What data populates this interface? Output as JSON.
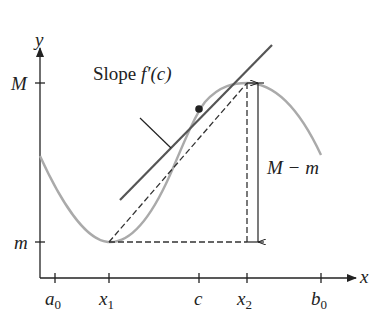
{
  "labels": {
    "y_axis": "y",
    "x_axis": "x",
    "M": "M",
    "m": "m",
    "slope_text": "Slope ",
    "slope_expr": "f′(c)",
    "range": "M − m",
    "ticks": {
      "a0": {
        "base": "a",
        "sub": "0"
      },
      "x1": {
        "base": "x",
        "sub": "1"
      },
      "c": {
        "base": "c",
        "sub": ""
      },
      "x2": {
        "base": "x",
        "sub": "2"
      },
      "b0": {
        "base": "b",
        "sub": "0"
      }
    }
  },
  "colors": {
    "axis": "#222222",
    "curve": "#aaaaaa",
    "tangent": "#555555",
    "dashed": "#333333"
  }
}
